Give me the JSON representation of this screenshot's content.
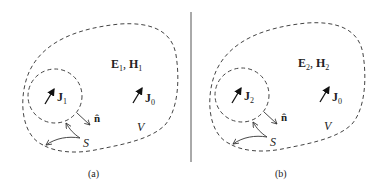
{
  "panels": [
    {
      "id": "a",
      "caption": "(a)",
      "field_label": {
        "E": "E",
        "E_sub": "1",
        "sep": ", ",
        "H": "H",
        "H_sub": "1"
      },
      "inner_current": {
        "symbol": "J",
        "sub": "1"
      },
      "outer_current": {
        "symbol": "J",
        "sub": "0"
      },
      "normal_label": "n̂",
      "volume_label": "V",
      "surface_label": "S"
    },
    {
      "id": "b",
      "caption": "(b)",
      "field_label": {
        "E": "E",
        "E_sub": "2",
        "sep": ", ",
        "H": "H",
        "H_sub": "2"
      },
      "inner_current": {
        "symbol": "J",
        "sub": "2"
      },
      "outer_current": {
        "symbol": "J",
        "sub": "0"
      },
      "normal_label": "n̂",
      "volume_label": "V",
      "surface_label": "S"
    }
  ],
  "colors": {
    "line": "#444444",
    "text": "#222222",
    "background": "#ffffff"
  }
}
